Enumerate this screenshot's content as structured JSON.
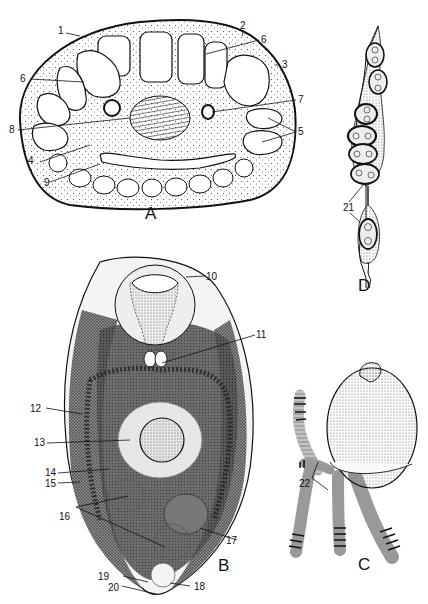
{
  "figure": {
    "panels": [
      {
        "id": "A",
        "label": "A",
        "description": "Transverse section"
      },
      {
        "id": "B",
        "label": "B",
        "description": "Whole body, internal anatomy"
      },
      {
        "id": "C",
        "label": "C",
        "description": "Body with attached appendages"
      },
      {
        "id": "D",
        "label": "D",
        "description": "Chain of encapsulated eggs"
      }
    ],
    "labels": {
      "l1": "1",
      "l2": "2",
      "l3": "3",
      "l4": "4",
      "l5": "5",
      "l6a": "6",
      "l6b": "6",
      "l7": "7",
      "l8": "8",
      "l9": "9",
      "l10": "10",
      "l11": "11",
      "l12": "12",
      "l13": "13",
      "l14": "14",
      "l15": "15",
      "l16": "16",
      "l17": "17",
      "l18": "18",
      "l19": "19",
      "l20": "20",
      "l21": "21",
      "l22": "22"
    },
    "colors": {
      "ink": "#111111",
      "background": "#ffffff",
      "stipple": "#555555",
      "tissue": "#6a6a6a"
    }
  }
}
